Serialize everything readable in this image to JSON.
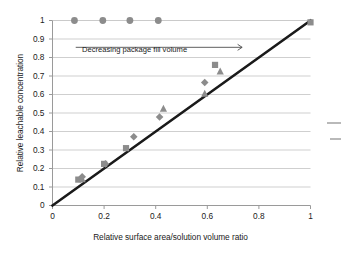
{
  "chart_data": {
    "type": "scatter",
    "title": "",
    "xlabel": "Relative surface area/solution volume ratio",
    "ylabel": "Relative leachable concentration",
    "xlim": [
      0,
      1
    ],
    "ylim": [
      0,
      1
    ],
    "xticks": [
      "0",
      "0.2",
      "0.4",
      "0.6",
      "0.8",
      "1"
    ],
    "xtick_values": [
      0,
      0.2,
      0.4,
      0.6,
      0.8,
      1
    ],
    "yticks": [
      "0",
      "0.1",
      "0.2",
      "0.3",
      "0.4",
      "0.5",
      "0.6",
      "0.7",
      "0.8",
      "0.9",
      "1"
    ],
    "ytick_values": [
      0,
      0.1,
      0.2,
      0.3,
      0.4,
      0.5,
      0.6,
      0.7,
      0.8,
      0.9,
      1
    ],
    "grid": "horizontal",
    "legend": "none",
    "marker_color": "#8c8c8c",
    "line_color": "#1a1a1a",
    "grid_color": "#c9c9c9",
    "axis_color": "#9a9a9a",
    "series": [
      {
        "name": "Saturated / full extraction",
        "marker": "circle",
        "points": [
          {
            "x": 0.085,
            "y": 1.0
          },
          {
            "x": 0.195,
            "y": 1.0
          },
          {
            "x": 0.3,
            "y": 1.0
          },
          {
            "x": 0.41,
            "y": 1.0
          }
        ]
      },
      {
        "name": "Series A",
        "marker": "square",
        "points": [
          {
            "x": 0.1,
            "y": 0.14
          },
          {
            "x": 0.2,
            "y": 0.225
          },
          {
            "x": 0.285,
            "y": 0.31
          },
          {
            "x": 0.63,
            "y": 0.76
          },
          {
            "x": 1.0,
            "y": 0.99
          }
        ]
      },
      {
        "name": "Series B",
        "marker": "diamond",
        "points": [
          {
            "x": 0.115,
            "y": 0.155
          },
          {
            "x": 0.205,
            "y": 0.225
          },
          {
            "x": 0.315,
            "y": 0.372
          },
          {
            "x": 0.415,
            "y": 0.478
          },
          {
            "x": 0.59,
            "y": 0.665
          }
        ]
      },
      {
        "name": "Series C",
        "marker": "triangle",
        "points": [
          {
            "x": 0.115,
            "y": 0.142
          },
          {
            "x": 0.43,
            "y": 0.523
          },
          {
            "x": 0.59,
            "y": 0.605
          },
          {
            "x": 0.65,
            "y": 0.725
          }
        ]
      }
    ],
    "reference_line": {
      "name": "unity line",
      "from": {
        "x": 0,
        "y": 0
      },
      "to": {
        "x": 1,
        "y": 1
      }
    },
    "annotations": [
      {
        "name": "decreasing-package-fill-volume",
        "text": "Decreasing package fill volume",
        "arrow_from": {
          "x": 0.09,
          "y": 0.855
        },
        "arrow_to": {
          "x": 0.735,
          "y": 0.855
        },
        "direction": "right"
      }
    ]
  }
}
